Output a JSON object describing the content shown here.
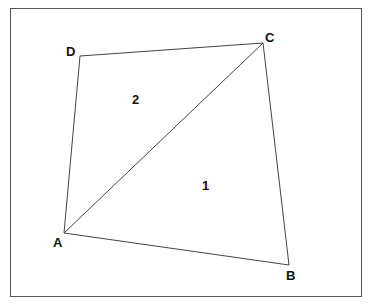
{
  "diagram": {
    "type": "quadrilateral-with-diagonal",
    "vertices": [
      {
        "name": "A",
        "x": 64,
        "y": 233,
        "label_x": 53,
        "label_y": 236
      },
      {
        "name": "B",
        "x": 289,
        "y": 265,
        "label_x": 286,
        "label_y": 269
      },
      {
        "name": "C",
        "x": 263,
        "y": 43,
        "label_x": 265,
        "label_y": 31
      },
      {
        "name": "D",
        "x": 80,
        "y": 56,
        "label_x": 66,
        "label_y": 45
      }
    ],
    "edges": [
      [
        "A",
        "B"
      ],
      [
        "B",
        "C"
      ],
      [
        "C",
        "D"
      ],
      [
        "D",
        "A"
      ],
      [
        "A",
        "C"
      ]
    ],
    "regions": [
      {
        "label": "1",
        "x": 202,
        "y": 179
      },
      {
        "label": "2",
        "x": 132,
        "y": 93
      }
    ],
    "stroke_color": "#444444"
  }
}
